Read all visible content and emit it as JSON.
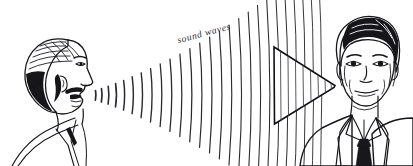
{
  "illustration": {
    "title": "Sound waves travelling from a speaking man to a listening man",
    "domain": "Natural-Image",
    "background_color": "#ffffff",
    "ink_color": "#16161a",
    "width": 413,
    "height": 166,
    "annotation": {
      "label": "sound waves",
      "rotation_degrees": -15,
      "x": 178,
      "y": 42,
      "font_style": "italic serif"
    },
    "figures": [
      {
        "id": "speaker",
        "name": "man-profile-left",
        "description": "Man shown in left-facing profile with wavy hair, moustache and open mouth, wearing a shirt collar",
        "position": "left",
        "facing": "right",
        "role": "sound source"
      },
      {
        "id": "listener",
        "name": "man-front-facing-right",
        "description": "Man shown front-facing with wavy hair, wearing a suit jacket, shirt collar and patterned necktie",
        "position": "right",
        "facing": "viewer",
        "role": "sound receiver"
      }
    ],
    "elements": {
      "wave_arcs": {
        "name": "sound-wave-arcs",
        "count": 26,
        "origin_x": 92,
        "origin_y": 95,
        "description": "Series of concentric curved arc strokes expanding rightwards from the speaker's mouth"
      },
      "cone": {
        "name": "sound-cone",
        "description": "Triangular horn or cone pointing right toward the listener, filled with vertical stripe lines",
        "apex_x": 335,
        "apex_y": 86,
        "base_x": 274,
        "base_top_y": 47,
        "base_bottom_y": 124,
        "stripe_count": 8
      }
    }
  }
}
